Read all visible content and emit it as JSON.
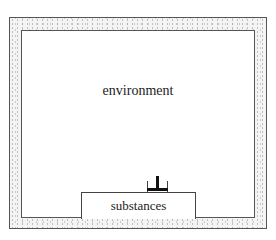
{
  "diagram": {
    "environment_label": "environment",
    "substances_label": "substances",
    "connector_icon": "t-junction-icon",
    "colors": {
      "border": "#555555",
      "stipple": "#9a9a9a",
      "background": "#ffffff"
    }
  }
}
